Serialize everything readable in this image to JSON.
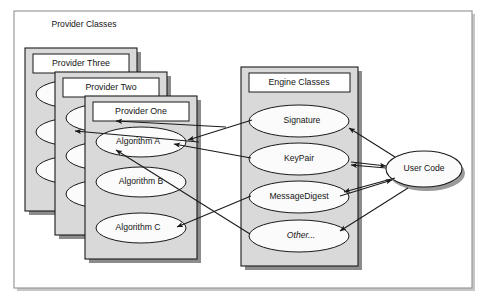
{
  "diagram": {
    "outer_frame_label": "",
    "section_label": "Provider Classes",
    "colors": {
      "panel_fill": "#d9d9d9",
      "panel_stroke": "#1a1a1a",
      "shadow": "#8c8c8c",
      "titlebox_fill": "#ffffff",
      "ellipse_fill": "#fbfbfb",
      "ellipse_stroke": "#1a1a1a",
      "arrow": "#1a1a1a",
      "frame_stroke": "#b0b0b0",
      "text": "#141414"
    },
    "provider_stack": [
      {
        "name": "provider-three",
        "label": "Provider Three",
        "algorithms": [
          "",
          "",
          ""
        ]
      },
      {
        "name": "provider-two",
        "label": "Provider Two",
        "algorithms": [
          "",
          "",
          ""
        ]
      },
      {
        "name": "provider-one",
        "label": "Provider One",
        "algorithms": [
          "Algorithm A",
          "Algorithm B",
          "Algorithm C"
        ]
      }
    ],
    "engine_panel": {
      "label": "Engine Classes",
      "classes": [
        {
          "name": "signature",
          "label": "Signature",
          "italic": false
        },
        {
          "name": "keypair",
          "label": "KeyPair",
          "italic": false
        },
        {
          "name": "messagedigest",
          "label": "MessageDigest",
          "italic": false
        },
        {
          "name": "other",
          "label": "Other...",
          "italic": true
        }
      ]
    },
    "user_code": {
      "label": "User Code"
    },
    "connections": [
      {
        "from": "user-code",
        "to": "signature",
        "label": ""
      },
      {
        "from": "user-code",
        "to": "keypair",
        "label": ""
      },
      {
        "from": "user-code",
        "to": "messagedigest",
        "label": ""
      },
      {
        "from": "user-code",
        "to": "other",
        "label": ""
      },
      {
        "from": "signature",
        "to": "provider-one-algorithm-a",
        "label": ""
      },
      {
        "from": "keypair",
        "to": "provider-one-algorithm-a",
        "label": ""
      },
      {
        "from": "messagedigest",
        "to": "provider-one-algorithm-c",
        "label": ""
      },
      {
        "from": "other",
        "to": "provider-two-algorithm",
        "label": ""
      },
      {
        "from": "signature",
        "to": "provider-three-algorithm",
        "label": ""
      }
    ]
  }
}
